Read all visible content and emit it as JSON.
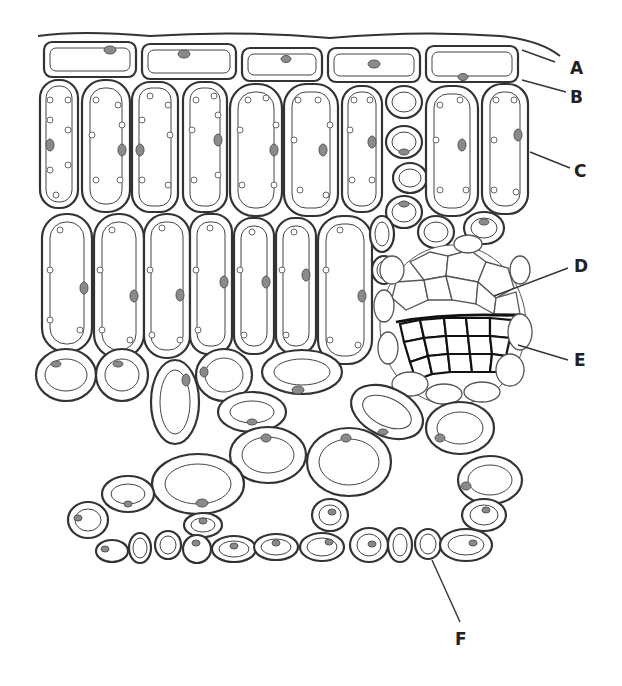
{
  "figure": {
    "caption_cropped": ""
  },
  "labels": [
    {
      "id": "A",
      "text": "A",
      "x": 578,
      "y": 74,
      "lx1": 545,
      "ly1": 62,
      "lx2": 520,
      "ly2": 50
    },
    {
      "id": "B",
      "text": "B",
      "x": 578,
      "y": 103,
      "lx1": 560,
      "ly1": 92,
      "lx2": 522,
      "ly2": 80
    },
    {
      "id": "C",
      "text": "C",
      "x": 578,
      "y": 177,
      "lx1": 565,
      "ly1": 166,
      "lx2": 530,
      "ly2": 152
    },
    {
      "id": "D",
      "text": "D",
      "x": 576,
      "y": 272,
      "lx1": 568,
      "ly1": 268,
      "lx2": 492,
      "ly2": 296
    },
    {
      "id": "E",
      "text": "E",
      "x": 576,
      "y": 366,
      "lx1": 568,
      "ly1": 360,
      "lx2": 520,
      "ly2": 345
    },
    {
      "id": "F",
      "text": "F",
      "x": 455,
      "y": 645,
      "lx1": 459,
      "ly1": 622,
      "lx2": 432,
      "ly2": 560
    }
  ],
  "structures": {
    "A": "cuticle",
    "B": "upper epidermis",
    "C": "palisade mesophyll",
    "D": "xylem",
    "E": "phloem",
    "F": "guard cell"
  },
  "colors": {
    "outline": "#333333",
    "nucleus": "#8a8a8a",
    "background": "#ffffff",
    "label": "#222222"
  }
}
